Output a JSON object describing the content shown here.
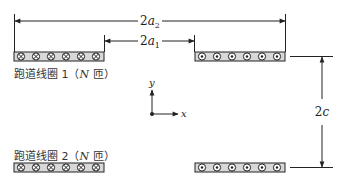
{
  "diagram": {
    "type": "racetrack-coil-geometry",
    "colors": {
      "line": "#222222",
      "coil_fill": "#d8d8d8",
      "background": "#ffffff"
    },
    "dimensions": {
      "outer_width": {
        "label_prefix": "2",
        "label_var": "a",
        "label_sub": "2"
      },
      "inner_width": {
        "label_prefix": "2",
        "label_var": "a",
        "label_sub": "1"
      },
      "separation": {
        "label_prefix": "2",
        "label_var": "c"
      }
    },
    "coils": [
      {
        "name": "coil-1",
        "label_text": "跑道线圈 1（",
        "label_var": "N",
        "label_suffix": " 匝）",
        "left_symbol": "cross-into-page",
        "right_symbol": "dot-out-of-page",
        "turns_shown": 6
      },
      {
        "name": "coil-2",
        "label_text": "跑道线圈 2（",
        "label_var": "N",
        "label_suffix": " 匝）",
        "left_symbol": "cross-into-page",
        "right_symbol": "dot-out-of-page",
        "turns_shown": 6
      }
    ],
    "axes": {
      "x_label": "x",
      "y_label": "y"
    }
  }
}
